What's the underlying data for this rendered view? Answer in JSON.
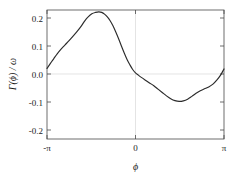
{
  "chart_data": {
    "type": "line",
    "title": "",
    "subtitle": "",
    "xlabel": "ϕ",
    "ylabel": "Γ(ϕ) / ω",
    "xlim": [
      -3.14159,
      3.14159
    ],
    "ylim": [
      -0.2,
      0.22
    ],
    "xticks": [
      -3.14159,
      0,
      3.14159
    ],
    "xticklabels": [
      "-π",
      "0",
      "π"
    ],
    "yticks": [
      0.2,
      0.1,
      0.0,
      -0.1,
      -0.2
    ],
    "yticklabels": [
      "0.2",
      "0.1",
      "0.0",
      "-0.1",
      "-0.2"
    ],
    "grid": true,
    "grid_lines": [
      "y=0.0",
      "x=0"
    ],
    "legend": null,
    "line_color": "#2b2b2b",
    "series": [
      {
        "name": "Γ(ϕ)/ω",
        "x": [
          -3.14159,
          -3.02,
          -2.9,
          -2.78,
          -2.65,
          -2.5,
          -2.35,
          -2.2,
          -2.05,
          -1.92,
          -1.8,
          -1.68,
          -1.55,
          -1.42,
          -1.3,
          -1.2,
          -1.1,
          -1.0,
          -0.9,
          -0.8,
          -0.7,
          -0.6,
          -0.5,
          -0.4,
          -0.3,
          -0.2,
          -0.1,
          0.0,
          0.1,
          0.22,
          0.35,
          0.5,
          0.65,
          0.8,
          0.95,
          1.1,
          1.25,
          1.4,
          1.55,
          1.7,
          1.85,
          2.0,
          2.15,
          2.3,
          2.45,
          2.6,
          2.75,
          2.9,
          3.02,
          3.14159
        ],
        "y": [
          0.02,
          0.038,
          0.055,
          0.072,
          0.088,
          0.104,
          0.12,
          0.137,
          0.155,
          0.172,
          0.19,
          0.204,
          0.215,
          0.22,
          0.222,
          0.22,
          0.214,
          0.204,
          0.19,
          0.172,
          0.15,
          0.126,
          0.1,
          0.075,
          0.052,
          0.033,
          0.016,
          0.004,
          -0.004,
          -0.013,
          -0.022,
          -0.032,
          -0.042,
          -0.054,
          -0.066,
          -0.078,
          -0.088,
          -0.095,
          -0.098,
          -0.096,
          -0.09,
          -0.08,
          -0.069,
          -0.06,
          -0.053,
          -0.046,
          -0.036,
          -0.02,
          -0.004,
          0.018
        ]
      }
    ],
    "annotations": []
  },
  "figure": {
    "background_color": "#ffffff",
    "frame_color": "#4a4a4a",
    "grid_color": "#d8d8d8"
  }
}
